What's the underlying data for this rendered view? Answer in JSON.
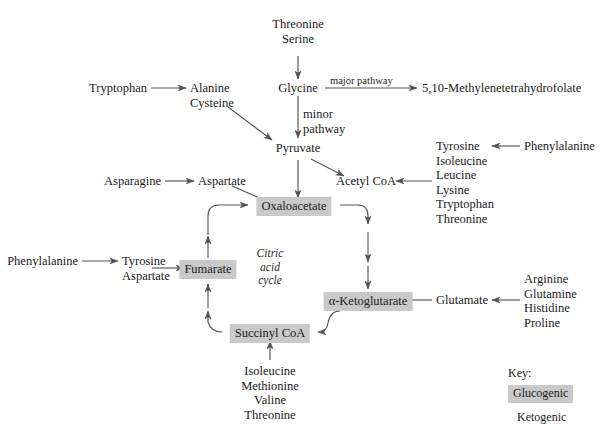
{
  "diagram": {
    "title_nodes": {
      "threonine_serine": "Threonine\nSerine",
      "glycine": "Glycine",
      "methylene_thf": "5,10-Methylenetetrahydrofolate",
      "tryptophan": "Tryptophan",
      "alanine_cysteine": "Alanine\nCysteine",
      "pyruvate": "Pyruvate",
      "acetyl_coa": "Acetyl CoA",
      "asparagine": "Asparagine",
      "aspartate": "Aspartate",
      "oxaloacetate": "Oxaloacetate",
      "fumarate": "Fumarate",
      "succinyl_coa": "Succinyl CoA",
      "alpha_ketoglutarate": "α-Ketoglutarate",
      "glutamate": "Glutamate",
      "phenylalanine_left": "Phenylalanine",
      "tyrosine_aspartate": "Tyrosine\nAspartate",
      "phenylalanine_right": "Phenylalanine"
    },
    "pathway_labels": {
      "major": "major pathway",
      "minor": "minor\npathway",
      "cycle": "Citric\nacid\ncycle"
    },
    "ketogenic_list": "Tyrosine\nIsoleucine\nLeucine\nLysine\nTryptophan\nThreonine",
    "glutamate_precursors": "Arginine\nGlutamine\nHistidine\nProline",
    "succinyl_precursors": "Isoleucine\nMethionine\nValine\nThreonine",
    "key": {
      "title": "Key:",
      "glucogenic": "Glucogenic",
      "ketogenic": "Ketogenic"
    },
    "colors": {
      "glucogenic_fill": "#c9c9c9",
      "ketogenic_fill": "#ffffff",
      "arrow": "#555555",
      "text": "#1a1a1a"
    }
  }
}
